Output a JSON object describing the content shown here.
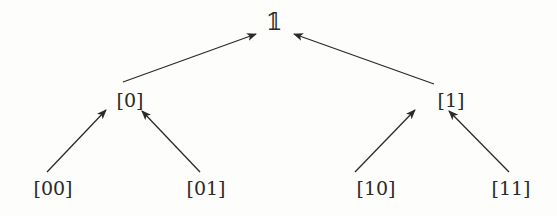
{
  "diagram": {
    "type": "tree",
    "direction": "bottom-to-top arrows (child points to parent)",
    "nodes": [
      {
        "id": "root",
        "label": "𝟙",
        "x": 274,
        "y": 22
      },
      {
        "id": "n0",
        "label": "[0]",
        "x": 130,
        "y": 100
      },
      {
        "id": "n1",
        "label": "[1]",
        "x": 451,
        "y": 100
      },
      {
        "id": "n00",
        "label": "[00]",
        "x": 53,
        "y": 188
      },
      {
        "id": "n01",
        "label": "[01]",
        "x": 206,
        "y": 188
      },
      {
        "id": "n10",
        "label": "[10]",
        "x": 376,
        "y": 188
      },
      {
        "id": "n11",
        "label": "[11]",
        "x": 511,
        "y": 188
      }
    ],
    "edges": [
      {
        "from": "n0",
        "to": "root"
      },
      {
        "from": "n1",
        "to": "root"
      },
      {
        "from": "n00",
        "to": "n0"
      },
      {
        "from": "n01",
        "to": "n0"
      },
      {
        "from": "n10",
        "to": "n1"
      },
      {
        "from": "n11",
        "to": "n1"
      }
    ],
    "colors": {
      "line": "#2a2a2a",
      "background": "#fdfdfc"
    }
  }
}
